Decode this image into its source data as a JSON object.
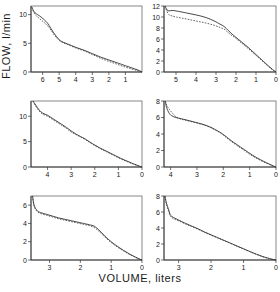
{
  "figure": {
    "xlabel": "VOLUME, liters",
    "ylabel": "FLOW, l/min",
    "layout": "2 columns x 3 rows of flow-volume curves"
  },
  "chart_data": [
    {
      "type": "line",
      "panel": "top-left",
      "title": "",
      "xlabel": "VOLUME, liters",
      "ylabel": "FLOW, l/min",
      "xlim": [
        6.7,
        0
      ],
      "ylim": [
        0,
        11.5
      ],
      "x_reversed": true,
      "xticks": [
        6,
        5,
        4,
        3,
        2,
        1
      ],
      "yticks": [
        0,
        5,
        10
      ],
      "grid": false,
      "legend": "none",
      "series": [
        {
          "name": "curve-solid",
          "style": "solid",
          "x": [
            6.65,
            6.55,
            6.45,
            6.3,
            6.1,
            5.9,
            5.7,
            5.5,
            5.2,
            4.9,
            4.5,
            4.0,
            3.5,
            3.0,
            2.5,
            2.0,
            1.5,
            1.0,
            0.6,
            0.3,
            0.1,
            0.0
          ],
          "y": [
            11.3,
            10.7,
            10.3,
            10.0,
            9.6,
            9.1,
            8.5,
            7.6,
            6.3,
            5.4,
            4.9,
            4.3,
            3.8,
            3.2,
            2.6,
            2.1,
            1.6,
            1.1,
            0.7,
            0.4,
            0.15,
            0.0
          ]
        },
        {
          "name": "curve-dotted",
          "style": "dotted",
          "x": [
            6.65,
            6.55,
            6.45,
            6.3,
            6.1,
            5.9,
            5.7,
            5.5,
            5.2,
            4.9,
            4.5,
            4.0,
            3.5,
            3.0,
            2.5,
            2.0,
            1.5,
            1.0,
            0.6,
            0.3,
            0.1,
            0.0
          ],
          "y": [
            11.3,
            10.5,
            10.0,
            9.6,
            9.1,
            8.6,
            8.1,
            7.3,
            6.1,
            5.3,
            4.8,
            4.2,
            3.7,
            3.05,
            2.4,
            1.85,
            1.35,
            0.85,
            0.5,
            0.25,
            0.08,
            0.0
          ]
        }
      ]
    },
    {
      "type": "line",
      "panel": "top-right",
      "title": "",
      "xlabel": "VOLUME, liters",
      "ylabel": "FLOW, l/min",
      "xlim": [
        5.6,
        0
      ],
      "ylim": [
        0,
        12
      ],
      "x_reversed": true,
      "xticks": [
        5,
        4,
        3,
        2,
        1,
        0
      ],
      "yticks": [
        0,
        2,
        4,
        6,
        8,
        10,
        12
      ],
      "grid": false,
      "legend": "none",
      "series": [
        {
          "name": "curve-solid",
          "style": "solid",
          "x": [
            5.55,
            5.45,
            5.35,
            5.2,
            5.0,
            4.7,
            4.3,
            3.9,
            3.5,
            3.1,
            2.8,
            2.6,
            2.4,
            2.2,
            2.0,
            1.7,
            1.4,
            1.1,
            0.8,
            0.5,
            0.25,
            0.1,
            0.0
          ],
          "y": [
            12.0,
            11.3,
            11.1,
            11.2,
            11.1,
            10.9,
            10.6,
            10.3,
            9.9,
            9.3,
            8.7,
            8.3,
            7.6,
            6.9,
            6.3,
            5.4,
            4.5,
            3.5,
            2.5,
            1.5,
            0.7,
            0.25,
            0.0
          ]
        },
        {
          "name": "curve-dotted",
          "style": "dotted",
          "x": [
            5.55,
            5.45,
            5.35,
            5.2,
            5.0,
            4.7,
            4.3,
            3.9,
            3.5,
            3.1,
            2.8,
            2.6,
            2.4,
            2.2,
            2.0,
            1.7,
            1.4,
            1.1,
            0.8,
            0.5,
            0.25,
            0.1,
            0.0
          ],
          "y": [
            12.0,
            11.0,
            10.4,
            10.2,
            10.0,
            9.8,
            9.5,
            9.2,
            8.9,
            8.5,
            8.1,
            7.8,
            7.2,
            6.6,
            6.1,
            5.2,
            4.3,
            3.35,
            2.4,
            1.4,
            0.6,
            0.2,
            0.0
          ]
        }
      ]
    },
    {
      "type": "line",
      "panel": "middle-left",
      "title": "",
      "xlabel": "VOLUME, liters",
      "ylabel": "FLOW, l/min",
      "xlim": [
        4.7,
        0
      ],
      "ylim": [
        0,
        13
      ],
      "x_reversed": true,
      "xticks": [
        4,
        3,
        2,
        1,
        0
      ],
      "yticks": [
        0,
        5,
        10
      ],
      "grid": false,
      "legend": "none",
      "series": [
        {
          "name": "curve-solid",
          "style": "solid",
          "x": [
            4.62,
            4.5,
            4.35,
            4.2,
            4.0,
            3.8,
            3.6,
            3.4,
            3.2,
            3.0,
            2.8,
            2.6,
            2.4,
            2.1,
            1.8,
            1.5,
            1.2,
            0.9,
            0.6,
            0.35,
            0.15,
            0.0
          ],
          "y": [
            13.0,
            12.2,
            11.2,
            10.6,
            10.2,
            9.6,
            9.0,
            8.4,
            7.8,
            7.1,
            6.5,
            6.0,
            5.5,
            4.6,
            3.8,
            3.1,
            2.4,
            1.7,
            1.1,
            0.6,
            0.25,
            0.0
          ]
        },
        {
          "name": "curve-dotted",
          "style": "dotted",
          "x": [
            4.62,
            4.5,
            4.35,
            4.2,
            4.0,
            3.8,
            3.6,
            3.4,
            3.2,
            3.0,
            2.8,
            2.6,
            2.4,
            2.1,
            1.8,
            1.5,
            1.2,
            0.9,
            0.6,
            0.35,
            0.15,
            0.0
          ],
          "y": [
            13.0,
            12.0,
            11.0,
            10.4,
            10.0,
            9.4,
            8.8,
            8.2,
            7.6,
            6.9,
            6.4,
            5.9,
            5.4,
            4.5,
            3.7,
            3.0,
            2.3,
            1.6,
            1.0,
            0.55,
            0.2,
            0.0
          ]
        }
      ]
    },
    {
      "type": "line",
      "panel": "middle-right",
      "title": "",
      "xlabel": "VOLUME, liters",
      "ylabel": "FLOW, l/min",
      "xlim": [
        4.25,
        0
      ],
      "ylim": [
        0,
        8
      ],
      "x_reversed": true,
      "xticks": [
        4,
        3,
        2,
        1,
        0
      ],
      "yticks": [
        0,
        2,
        4,
        6,
        8
      ],
      "grid": false,
      "legend": "none",
      "series": [
        {
          "name": "curve-solid",
          "style": "solid",
          "x": [
            4.2,
            4.15,
            4.05,
            3.95,
            3.8,
            3.6,
            3.4,
            3.1,
            2.8,
            2.5,
            2.2,
            2.05,
            1.9,
            1.7,
            1.5,
            1.2,
            0.9,
            0.6,
            0.35,
            0.15,
            0.0
          ],
          "y": [
            8.0,
            7.2,
            6.5,
            6.2,
            6.0,
            5.85,
            5.7,
            5.45,
            5.2,
            4.85,
            4.35,
            4.05,
            3.7,
            3.2,
            2.75,
            2.1,
            1.45,
            0.9,
            0.5,
            0.2,
            0.0
          ]
        },
        {
          "name": "curve-dotted",
          "style": "dotted",
          "x": [
            4.2,
            4.15,
            4.05,
            3.95,
            3.8,
            3.6,
            3.4,
            3.1,
            2.8,
            2.5,
            2.2,
            2.05,
            1.9,
            1.7,
            1.5,
            1.2,
            0.9,
            0.6,
            0.35,
            0.15,
            0.0
          ],
          "y": [
            8.0,
            7.5,
            7.0,
            6.6,
            6.1,
            5.8,
            5.65,
            5.4,
            5.15,
            4.8,
            4.3,
            4.0,
            3.6,
            3.1,
            2.65,
            2.0,
            1.35,
            0.82,
            0.45,
            0.17,
            0.0
          ]
        }
      ]
    },
    {
      "type": "line",
      "panel": "bottom-left",
      "title": "",
      "xlabel": "VOLUME, liters",
      "ylabel": "FLOW, l/min",
      "xlim": [
        3.6,
        0
      ],
      "ylim": [
        0,
        7
      ],
      "x_reversed": true,
      "xticks": [
        3,
        2,
        1,
        0
      ],
      "yticks": [
        0,
        2,
        4,
        6
      ],
      "grid": false,
      "legend": "none",
      "series": [
        {
          "name": "curve-solid",
          "style": "solid",
          "x": [
            3.55,
            3.5,
            3.4,
            3.3,
            3.1,
            2.9,
            2.7,
            2.5,
            2.3,
            2.1,
            1.9,
            1.7,
            1.55,
            1.4,
            1.2,
            1.0,
            0.8,
            0.6,
            0.4,
            0.2,
            0.08,
            0.0
          ],
          "y": [
            7.0,
            6.0,
            5.4,
            5.2,
            5.0,
            4.8,
            4.6,
            4.45,
            4.3,
            4.15,
            4.0,
            3.85,
            3.7,
            3.3,
            2.6,
            2.0,
            1.5,
            1.05,
            0.65,
            0.3,
            0.1,
            0.0
          ]
        },
        {
          "name": "curve-dotted",
          "style": "dotted",
          "x": [
            3.55,
            3.5,
            3.4,
            3.3,
            3.1,
            2.9,
            2.7,
            2.5,
            2.3,
            2.1,
            1.9,
            1.7,
            1.55,
            1.4,
            1.2,
            1.0,
            0.8,
            0.6,
            0.4,
            0.2,
            0.08,
            0.0
          ],
          "y": [
            7.0,
            5.9,
            5.3,
            5.1,
            4.9,
            4.7,
            4.5,
            4.35,
            4.2,
            4.05,
            3.9,
            3.75,
            3.55,
            3.15,
            2.5,
            1.92,
            1.42,
            1.0,
            0.6,
            0.28,
            0.09,
            0.0
          ]
        }
      ]
    },
    {
      "type": "line",
      "panel": "bottom-right",
      "title": "",
      "xlabel": "VOLUME, liters",
      "ylabel": "FLOW, l/min",
      "xlim": [
        3.45,
        0
      ],
      "ylim": [
        0,
        8
      ],
      "x_reversed": true,
      "xticks": [
        3,
        2,
        1,
        0
      ],
      "yticks": [
        0,
        2,
        4,
        6,
        8
      ],
      "grid": false,
      "legend": "none",
      "series": [
        {
          "name": "curve-solid",
          "style": "solid",
          "x": [
            3.42,
            3.38,
            3.3,
            3.25,
            3.15,
            3.0,
            2.8,
            2.6,
            2.4,
            2.2,
            2.0,
            1.8,
            1.6,
            1.4,
            1.2,
            1.0,
            0.8,
            0.6,
            0.4,
            0.2,
            0.08,
            0.0
          ],
          "y": [
            8.0,
            7.2,
            6.2,
            5.6,
            5.3,
            5.0,
            4.6,
            4.25,
            3.9,
            3.5,
            3.15,
            2.8,
            2.45,
            2.1,
            1.75,
            1.4,
            1.05,
            0.72,
            0.42,
            0.18,
            0.06,
            0.0
          ]
        },
        {
          "name": "curve-dotted",
          "style": "dotted",
          "x": [
            3.42,
            3.38,
            3.3,
            3.25,
            3.15,
            3.0,
            2.8,
            2.6,
            2.4,
            2.2,
            2.0,
            1.8,
            1.6,
            1.4,
            1.2,
            1.0,
            0.8,
            0.6,
            0.4,
            0.2,
            0.08,
            0.0
          ],
          "y": [
            8.0,
            7.0,
            6.0,
            5.45,
            5.15,
            4.9,
            4.52,
            4.18,
            3.84,
            3.45,
            3.1,
            2.76,
            2.42,
            2.07,
            1.72,
            1.38,
            1.03,
            0.7,
            0.4,
            0.17,
            0.05,
            0.0
          ]
        }
      ]
    }
  ]
}
